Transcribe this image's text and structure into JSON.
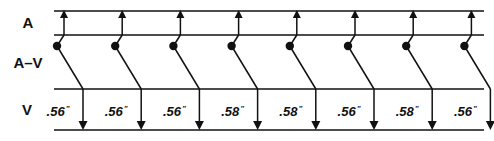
{
  "diagram": {
    "type": "ladder-diagram",
    "rows": [
      {
        "id": "A",
        "label": "A",
        "y_top": 11,
        "y_bottom": 35
      },
      {
        "id": "AV",
        "label": "A–V",
        "y_top": 35,
        "y_bottom": 89
      },
      {
        "id": "V",
        "label": "V",
        "y_top": 89,
        "y_bottom": 130
      }
    ],
    "intervals": [
      {
        "value": ".56",
        "unit": "\""
      },
      {
        "value": ".56",
        "unit": "\""
      },
      {
        "value": ".56",
        "unit": "\""
      },
      {
        "value": ".58",
        "unit": "\""
      },
      {
        "value": ".58",
        "unit": "\""
      },
      {
        "value": ".56",
        "unit": "\""
      },
      {
        "value": ".58",
        "unit": "\""
      },
      {
        "value": ".56",
        "unit": "\""
      }
    ],
    "beat_count": 8,
    "colors": {
      "stroke": "#111111",
      "background": "#ffffff"
    }
  }
}
